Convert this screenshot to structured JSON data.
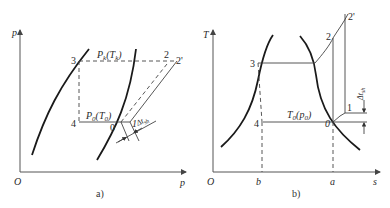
{
  "figure_a": {
    "caption": "a)",
    "y_axis_label": "p",
    "x_axis_label": "p",
    "origin_label": "O",
    "points": {
      "p3": "3",
      "p4": "4",
      "p0": "0",
      "p1": "1",
      "p2": "2",
      "p2prime": "2'"
    },
    "condensing_label": {
      "main": "P",
      "sub": "k",
      "paren_main": "(T",
      "paren_sub": "k",
      "close": ")"
    },
    "evap_label": {
      "main": "P",
      "sub": "0",
      "paren_main": "(T",
      "paren_sub": "0",
      "close": ")"
    },
    "superheat_label": {
      "main": "Δt",
      "sub": "sh"
    }
  },
  "figure_b": {
    "caption": "b)",
    "y_axis_label": "T",
    "x_axis_label": "s",
    "origin_label": "O",
    "tick_b": "b",
    "tick_a": "a",
    "points": {
      "p3": "3",
      "p4": "4",
      "p0": "0",
      "p1": "1",
      "p2": "2",
      "p2prime": "2'"
    },
    "evap_label": {
      "main": "T",
      "sub": "0",
      "paren_main": "(p",
      "paren_sub": "0",
      "close": ")"
    },
    "superheat_label": {
      "main": "Δt",
      "sub": "sh"
    }
  }
}
